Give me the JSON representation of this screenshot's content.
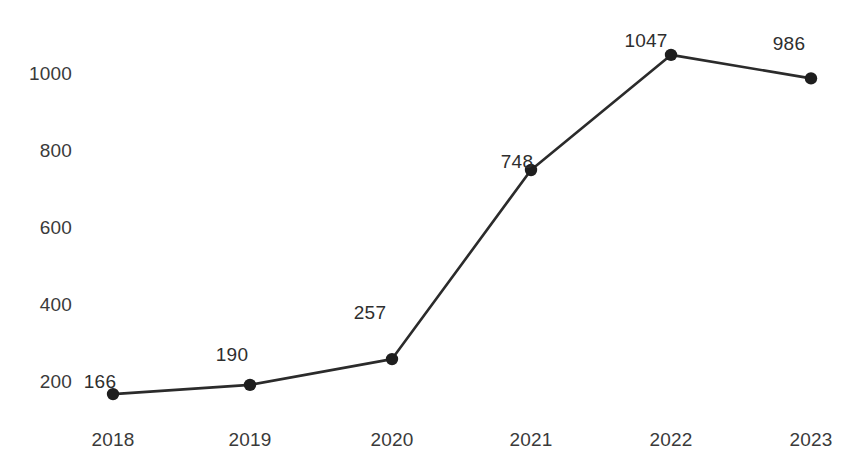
{
  "chart_data": {
    "type": "line",
    "title": "",
    "subtitle": "",
    "xlabel": "",
    "ylabel": "",
    "categories": [
      "2018",
      "2019",
      "2020",
      "2021",
      "2022",
      "2023"
    ],
    "values": [
      166,
      190,
      257,
      748,
      1047,
      986
    ],
    "point_labels": [
      "166",
      "190",
      "257",
      "748",
      "1047",
      "986"
    ],
    "series": [
      {
        "name": "",
        "values": [
          166,
          190,
          257,
          748,
          1047,
          986
        ]
      }
    ],
    "yticks": [
      200,
      400,
      600,
      800,
      1000
    ],
    "ytick_labels": [
      "200",
      "400",
      "600",
      "800",
      "1000"
    ],
    "xtick_labels": [
      "2018",
      "2019",
      "2020",
      "2021",
      "2022",
      "2023"
    ],
    "ylim": [
      120,
      1100
    ],
    "xlim": [
      2017.6,
      2023.4
    ],
    "grid": false,
    "legend": false,
    "legend_position": "none",
    "line_color": "#2b2b2b",
    "marker_color": "#1e1e1e",
    "text_color": "#3a3a3a",
    "background_color": "#ffffff"
  },
  "axes": {
    "yticks": [
      {
        "label": "1000",
        "top": 64
      },
      {
        "label": "800",
        "top": 141
      },
      {
        "label": "600",
        "top": 218
      },
      {
        "label": "400",
        "top": 295
      },
      {
        "label": "200",
        "top": 372
      }
    ],
    "xticks": [
      {
        "label": "2018",
        "left": 113
      },
      {
        "label": "2019",
        "left": 250
      },
      {
        "label": "2020",
        "left": 392
      },
      {
        "label": "2021",
        "left": 531
      },
      {
        "label": "2022",
        "left": 671
      },
      {
        "label": "2023",
        "left": 811
      }
    ]
  },
  "points": [
    {
      "label": "166",
      "cx": 112,
      "cy": 396,
      "lx": 100,
      "ly": 372
    },
    {
      "label": "190",
      "cx": 250,
      "cy": 385,
      "lx": 232,
      "ly": 345
    },
    {
      "label": "257",
      "cx": 392,
      "cy": 362,
      "lx": 370,
      "ly": 303
    },
    {
      "label": "748",
      "cx": 532,
      "cy": 175,
      "lx": 517,
      "ly": 152
    },
    {
      "label": "1047",
      "cx": 671,
      "cy": 58,
      "lx": 646,
      "ly": 31
    },
    {
      "label": "986, ",
      "cx": 811,
      "cy": 79,
      "lx": 789,
      "ly": 34
    }
  ],
  "point_label_texts": {
    "p0": "166",
    "p1": "190",
    "p2": "257",
    "p3": "748",
    "p4": "1047",
    "p5": "986"
  }
}
